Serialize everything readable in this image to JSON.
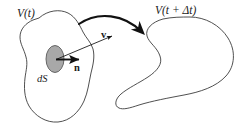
{
  "figure": {
    "background_color": "#ffffff",
    "outline_color": "#3c3c3c",
    "arrow_color": "#111111",
    "patch_fill_color": "#a8a8a8",
    "patch_stroke_color": "#5a5a5a"
  },
  "labels": {
    "volume_initial": "V(t)",
    "volume_final": "V(t + Δt)",
    "surface_element": "dS",
    "normal_vector": "n",
    "velocity_vector": "v"
  },
  "elements": {
    "left_blob_name": "material-volume-initial",
    "right_blob_name": "material-volume-final",
    "patch_name": "surface-element-patch",
    "normal_arrow_name": "normal-vector-arrow",
    "velocity_arrow_name": "velocity-vector-arrow",
    "transport_arrow_name": "transport-curved-arrow"
  }
}
